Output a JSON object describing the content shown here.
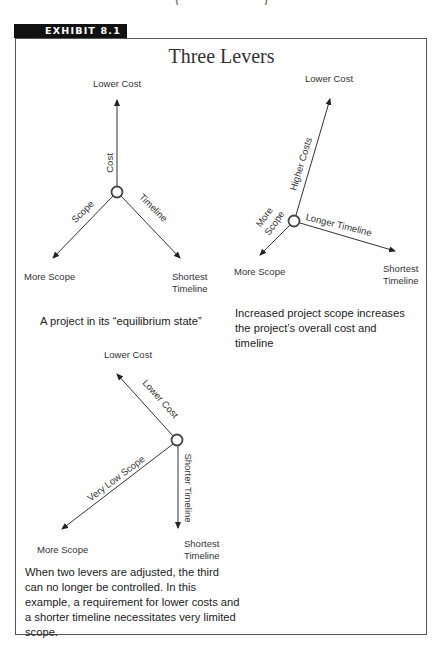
{
  "page": {
    "top_cut_text": "( ·  · · ·  ·  · ·  ·  · )"
  },
  "exhibit": {
    "label": "EXHIBIT 8.1",
    "title": "Three Levers",
    "accent_color": "#111111",
    "border_color": "#555555"
  },
  "diagrams": [
    {
      "id": "equilibrium",
      "endpoints": {
        "top": "Lower Cost",
        "left": "More Scope",
        "right_line1": "Shortest",
        "right_line2": "Timeline"
      },
      "lever_labels": {
        "cost": "Cost",
        "scope": "Scope",
        "timeline": "Timeline"
      },
      "caption": "A project in its “equilibrium state”"
    },
    {
      "id": "increased-scope",
      "endpoints": {
        "top": "Lower Cost",
        "left": "More Scope",
        "right_line1": "Shortest",
        "right_line2": "Timeline"
      },
      "lever_labels": {
        "cost": "Higher Costs",
        "scope_line1": "More",
        "scope_line2": "Scope",
        "timeline": "Longer Timeline"
      },
      "caption": "Increased project scope increases the project’s overall cost and timeline"
    },
    {
      "id": "two-levers-adjusted",
      "endpoints": {
        "top": "Lower Cost",
        "left": "More Scope",
        "right_line1": "Shortest",
        "right_line2": "Timeline"
      },
      "lever_labels": {
        "cost": "Lower Cost",
        "scope": "Very Low Scope",
        "timeline": "Shorter Timeline"
      },
      "caption": "When two levers are adjusted, the third can no longer be controlled. In this example, a requirement for lower costs and a shorter timeline necessitates very limited scope."
    }
  ]
}
